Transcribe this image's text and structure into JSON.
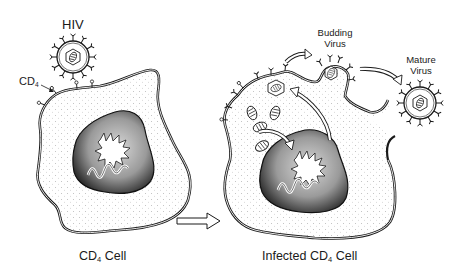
{
  "diagram": {
    "labels": {
      "hiv": "HIV",
      "cd4_pointer": "CD",
      "cd4_pointer_sub": "4",
      "budding_line1": "Budding",
      "budding_line2": "Virus",
      "mature_line1": "Mature",
      "mature_line2": "Virus",
      "left_caption_pre": "CD",
      "left_caption_sub": "4",
      "left_caption_post": " Cell",
      "right_caption_pre": "Infected CD",
      "right_caption_sub": "4",
      "right_caption_post": " Cell"
    },
    "colors": {
      "ink": "#1a1a1a",
      "cytoplasm": "#f2f2f2",
      "nucleus": "#5a5a5a",
      "background": "#ffffff"
    },
    "components": [
      {
        "id": "hiv-virion",
        "description": "free HIV virion near CD4 cell"
      },
      {
        "id": "cd4-cell",
        "description": "healthy CD4 cell with nucleus and CD4 receptors"
      },
      {
        "id": "transition-arrow",
        "description": "outline arrow pointing from CD4 cell to infected cell"
      },
      {
        "id": "infected-cell",
        "description": "infected CD4 cell with viral particles, budding virus and release"
      },
      {
        "id": "budding-virus",
        "description": "virus budding from the infected cell membrane"
      },
      {
        "id": "mature-virus",
        "description": "released mature virion"
      }
    ]
  }
}
